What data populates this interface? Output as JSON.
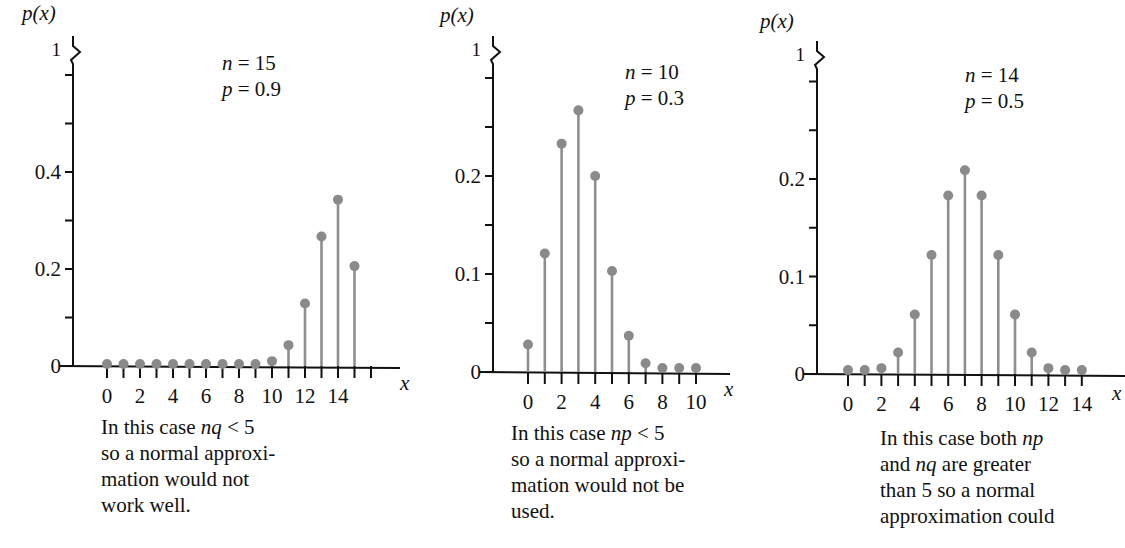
{
  "figure": {
    "panels": [
      {
        "id": "left",
        "y_label": "p(x)",
        "x_label": "x",
        "params": {
          "n_line": "n = 15",
          "p_line": "p = 0.9"
        },
        "caption": [
          "In this case nq < 5",
          "so a normal approxi-",
          "mation would not",
          "work well."
        ]
      },
      {
        "id": "middle",
        "y_label": "p(x)",
        "x_label": "x",
        "params": {
          "n_line": "n = 10",
          "p_line": "p = 0.3"
        },
        "caption": [
          "In this case np < 5",
          "so a normal approxi-",
          "mation would not be",
          "used."
        ]
      },
      {
        "id": "right",
        "y_label": "p(x)",
        "x_label": "x",
        "params": {
          "n_line": "n = 14",
          "p_line": "p = 0.5"
        },
        "caption": [
          "In this case both np",
          "and nq are greater",
          "than 5 so a normal",
          "approximation could"
        ]
      }
    ],
    "colors": {
      "axis": "#111111",
      "stem": "#8e8e8e",
      "marker": "#8a8a8a",
      "background": "#ffffff"
    }
  },
  "chart_data": [
    {
      "type": "bar",
      "subtype": "stem",
      "title": "Binomial distribution n=15, p=0.9",
      "xlabel": "x",
      "ylabel": "p(x)",
      "x": [
        0,
        1,
        2,
        3,
        4,
        5,
        6,
        7,
        8,
        9,
        10,
        11,
        12,
        13,
        14,
        15
      ],
      "values": [
        0,
        0,
        0,
        0,
        0,
        0,
        0,
        0,
        0,
        0.002,
        0.01,
        0.043,
        0.129,
        0.267,
        0.343,
        0.206
      ],
      "x_tick_labels": [
        "0",
        "2",
        "4",
        "6",
        "8",
        "10",
        "12",
        "14"
      ],
      "y_tick_labels": [
        "0",
        "0.2",
        "0.4",
        "1"
      ],
      "ylim": [
        0,
        1
      ],
      "y_axis_break": true,
      "annotations": [
        "n = 15",
        "p = 0.9"
      ],
      "grid": false
    },
    {
      "type": "bar",
      "subtype": "stem",
      "title": "Binomial distribution n=10, p=0.3",
      "xlabel": "x",
      "ylabel": "p(x)",
      "x": [
        0,
        1,
        2,
        3,
        4,
        5,
        6,
        7,
        8,
        9,
        10
      ],
      "values": [
        0.028,
        0.121,
        0.233,
        0.267,
        0.2,
        0.103,
        0.037,
        0.009,
        0.001,
        0.0,
        0.0
      ],
      "x_tick_labels": [
        "0",
        "2",
        "4",
        "6",
        "8",
        "10"
      ],
      "y_tick_labels": [
        "0",
        "0.1",
        "0.2",
        "1"
      ],
      "ylim": [
        0,
        1
      ],
      "y_axis_break": true,
      "annotations": [
        "n = 10",
        "p = 0.3"
      ],
      "grid": false
    },
    {
      "type": "bar",
      "subtype": "stem",
      "title": "Binomial distribution n=14, p=0.5",
      "xlabel": "x",
      "ylabel": "p(x)",
      "x": [
        0,
        1,
        2,
        3,
        4,
        5,
        6,
        7,
        8,
        9,
        10,
        11,
        12,
        13,
        14
      ],
      "values": [
        0.0,
        0.001,
        0.006,
        0.022,
        0.061,
        0.122,
        0.183,
        0.209,
        0.183,
        0.122,
        0.061,
        0.022,
        0.006,
        0.001,
        0.0
      ],
      "x_tick_labels": [
        "0",
        "2",
        "4",
        "6",
        "8",
        "10",
        "12",
        "14"
      ],
      "y_tick_labels": [
        "0",
        "0.1",
        "0.2",
        "1"
      ],
      "ylim": [
        0,
        1
      ],
      "y_axis_break": true,
      "annotations": [
        "n = 14",
        "p = 0.5"
      ],
      "grid": false
    }
  ]
}
